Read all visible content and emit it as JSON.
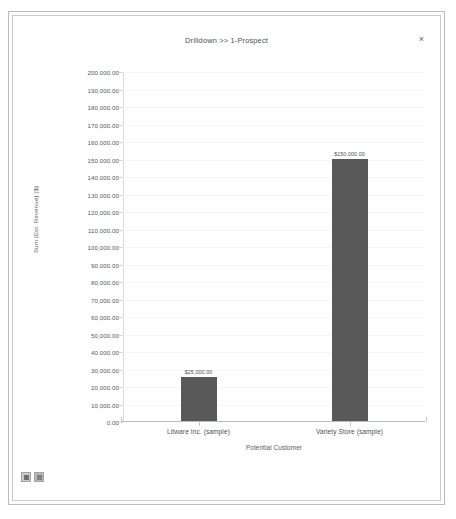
{
  "window": {
    "title": "Drilldown >> 1-Prospect",
    "close_label": "×"
  },
  "toolbar": {
    "buttons": [
      {
        "name": "chart-view-button",
        "icon": "chart-icon"
      },
      {
        "name": "data-view-button",
        "icon": "grid-icon"
      }
    ]
  },
  "chart_data": {
    "type": "bar",
    "title": "Drilldown >> 1-Prospect",
    "categories": [
      "Litware Inc. (sample)",
      "Variety Store (sample)"
    ],
    "values": [
      25000,
      150000
    ],
    "data_labels": [
      "$25,000.00",
      "$150,000.00"
    ],
    "xlabel": "Potential Customer",
    "ylabel": "Sum (Est. Revenue) ($)",
    "ylim": [
      0,
      200000
    ],
    "ytick_step": 10000,
    "ytick_labels": [
      "200,000.00",
      "190,000.00",
      "180,000.00",
      "170,000.00",
      "160,000.00",
      "150,000.00",
      "140,000.00",
      "130,000.00",
      "120,000.00",
      "110,000.00",
      "100,000.00",
      "90,000.00",
      "80,000.00",
      "70,000.00",
      "60,000.00",
      "50,000.00",
      "40,000.00",
      "30,000.00",
      "20,000.00",
      "10,000.00",
      "0.00"
    ],
    "grid": true,
    "legend": "none",
    "bar_color": "#595959"
  }
}
